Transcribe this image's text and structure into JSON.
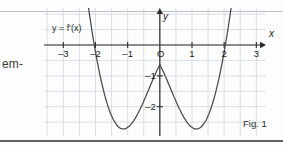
{
  "page": {
    "margin_text": "em-",
    "figure_caption": "Fig. 1",
    "background_color": "#fdfdfd",
    "rule_color": "#5d6266"
  },
  "plot": {
    "curve_label": "y = f'(x)",
    "x_axis_name": "x",
    "y_axis_name": "y",
    "origin_label": "O",
    "grid_color": "#c9d3dc",
    "axis_color": "#2b2b2b",
    "curve_color": "#4a4a4a",
    "x_ticks": [
      {
        "value": -3,
        "label": "–3"
      },
      {
        "value": -2,
        "label": "–2"
      },
      {
        "value": -1,
        "label": "–1"
      },
      {
        "value": 0,
        "label": "O"
      },
      {
        "value": 1,
        "label": "1"
      },
      {
        "value": 2,
        "label": "2"
      },
      {
        "value": 3,
        "label": "3"
      }
    ],
    "y_ticks": [
      {
        "value": -1,
        "label": "–1"
      },
      {
        "value": -2,
        "label": "–2"
      }
    ]
  },
  "chart_data": {
    "type": "line",
    "title": "",
    "subtitle": "",
    "xlabel": "x",
    "ylabel": "y",
    "legend": [
      "y = f'(x)"
    ],
    "legend_position": "upper-left-inline",
    "grid": true,
    "grid_step": 0.5,
    "xlim": [
      -3.6,
      3.3
    ],
    "ylim": [
      -2.95,
      1.2
    ],
    "annotations": [
      "Fig. 1"
    ],
    "roots": [
      -2,
      2
    ],
    "local_maximum": {
      "x": 0,
      "y": -0.45
    },
    "local_minima": [
      {
        "x": -1.4,
        "y": -2.5
      },
      {
        "x": 1.4,
        "y": -2.5
      }
    ],
    "series": [
      {
        "name": "y = f'(x)",
        "x": [
          -2.32,
          -2.28,
          -2.24,
          -2.2,
          -2.16,
          -2.12,
          -2.08,
          -2.04,
          -2.0,
          -1.96,
          -1.92,
          -1.88,
          -1.84,
          -1.8,
          -1.76,
          -1.72,
          -1.68,
          -1.64,
          -1.6,
          -1.56,
          -1.52,
          -1.48,
          -1.44,
          -1.4,
          -1.36,
          -1.32,
          -1.28,
          -1.24,
          -1.2,
          -1.16,
          -1.12,
          -1.08,
          -1.04,
          -1.0,
          -0.96,
          -0.92,
          -0.88,
          -0.84,
          -0.8,
          -0.76,
          -0.72,
          -0.68,
          -0.64,
          -0.6,
          -0.56,
          -0.52,
          -0.48,
          -0.44,
          -0.4,
          -0.36,
          -0.32,
          -0.28,
          -0.24,
          -0.2,
          -0.16,
          -0.12,
          -0.08,
          -0.04,
          0.0,
          0.04,
          0.08,
          0.12,
          0.16,
          0.2,
          0.24,
          0.28,
          0.32,
          0.36,
          0.4,
          0.44,
          0.48,
          0.52,
          0.56,
          0.6,
          0.64,
          0.68,
          0.72,
          0.76,
          0.8,
          0.84,
          0.88,
          0.92,
          0.96,
          1.0,
          1.04,
          1.08,
          1.12,
          1.16,
          1.2,
          1.24,
          1.28,
          1.32,
          1.36,
          1.4,
          1.44,
          1.48,
          1.52,
          1.56,
          1.6,
          1.64,
          1.68,
          1.72,
          1.76,
          1.8,
          1.84,
          1.88,
          1.92,
          1.96,
          2.0,
          2.04,
          2.08,
          2.12,
          2.16,
          2.2,
          2.24,
          2.28,
          2.32
        ],
        "y": [
          2.02,
          1.7,
          1.39,
          1.09,
          0.81,
          0.53,
          0.27,
          0.02,
          -0.22,
          -0.45,
          -0.67,
          -0.88,
          -1.07,
          -1.26,
          -1.43,
          -1.6,
          -1.75,
          -1.89,
          -2.02,
          -2.14,
          -2.25,
          -2.34,
          -2.43,
          -2.5,
          -2.56,
          -2.62,
          -2.66,
          -2.69,
          -2.71,
          -2.72,
          -2.72,
          -2.72,
          -2.7,
          -2.67,
          -2.64,
          -2.6,
          -2.55,
          -2.5,
          -2.43,
          -2.37,
          -2.29,
          -2.22,
          -2.13,
          -2.05,
          -1.96,
          -1.87,
          -1.77,
          -1.68,
          -1.58,
          -1.48,
          -1.38,
          -1.28,
          -1.18,
          -1.08,
          -0.99,
          -0.89,
          -0.8,
          -0.72,
          -0.63,
          -0.72,
          -0.8,
          -0.89,
          -0.99,
          -1.08,
          -1.18,
          -1.28,
          -1.38,
          -1.48,
          -1.58,
          -1.68,
          -1.77,
          -1.87,
          -1.96,
          -2.05,
          -2.13,
          -2.22,
          -2.29,
          -2.37,
          -2.43,
          -2.5,
          -2.55,
          -2.6,
          -2.64,
          -2.67,
          -2.7,
          -2.72,
          -2.72,
          -2.72,
          -2.71,
          -2.69,
          -2.66,
          -2.62,
          -2.56,
          -2.5,
          -2.43,
          -2.34,
          -2.25,
          -2.14,
          -2.02,
          -1.89,
          -1.75,
          -1.6,
          -1.43,
          -1.26,
          -1.07,
          -0.88,
          -0.67,
          -0.45,
          -0.22,
          0.02,
          0.27,
          0.53,
          0.81,
          1.09,
          1.39,
          1.7,
          2.02
        ]
      }
    ]
  }
}
